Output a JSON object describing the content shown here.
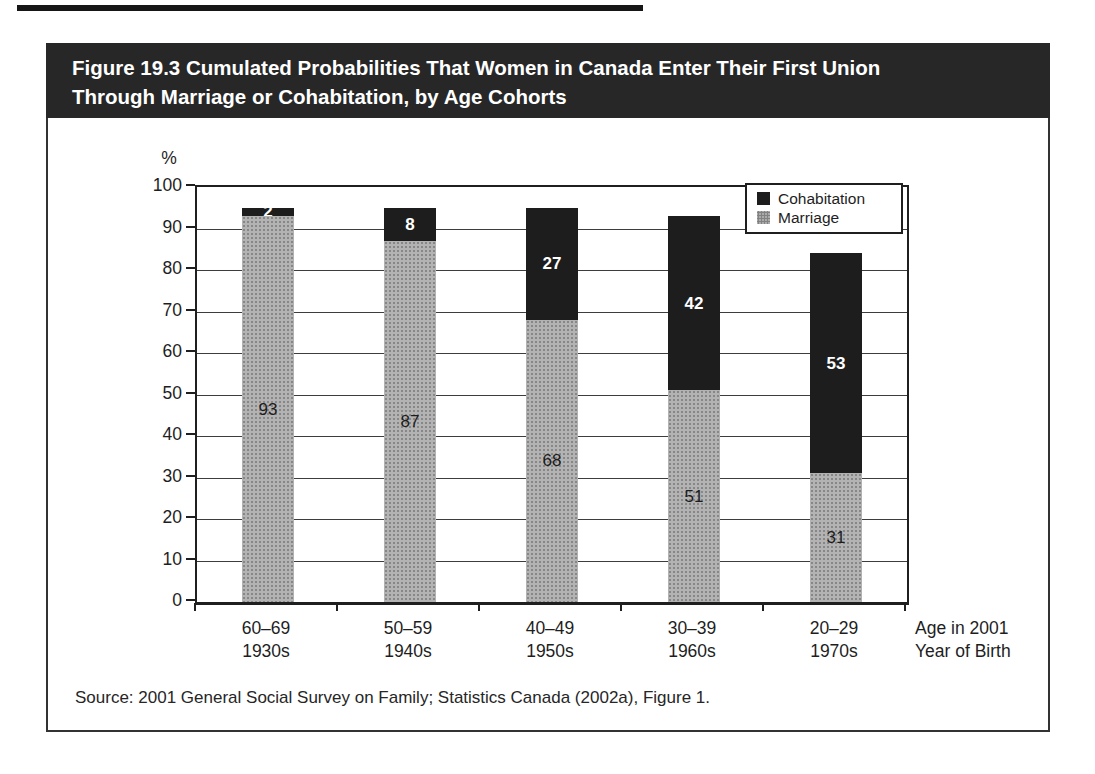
{
  "figure": {
    "title_line1": "Figure 19.3 Cumulated Probabilities That Women in Canada Enter Their First Union",
    "title_line2": "Through Marriage or Cohabitation, by Age Cohorts",
    "source": "Source: 2001 General Social Survey on Family; Statistics Canada (2002a), Figure 1."
  },
  "chart_data": {
    "type": "bar",
    "stacked": true,
    "title": "Figure 19.3 Cumulated Probabilities That Women in Canada Enter Their First Union Through Marriage or Cohabitation, by Age Cohorts",
    "unit_label": "%",
    "ylim": [
      0,
      100
    ],
    "yticks": [
      0,
      10,
      20,
      30,
      40,
      50,
      60,
      70,
      80,
      90,
      100
    ],
    "ytick_interval": 10,
    "grid": true,
    "categories": [
      "60–69",
      "50–59",
      "40–49",
      "30–39",
      "20–29"
    ],
    "cohorts": [
      "1930s",
      "1940s",
      "1950s",
      "1960s",
      "1970s"
    ],
    "series": [
      {
        "name": "Marriage",
        "color": "#b3b3b3",
        "values": [
          93,
          87,
          68,
          51,
          31
        ]
      },
      {
        "name": "Cohabitation",
        "color": "#1d1d1d",
        "values": [
          2,
          8,
          27,
          42,
          53
        ]
      }
    ],
    "legend_position": "top-right",
    "legend_entries": [
      "Cohabitation",
      "Marriage"
    ],
    "x_axis_note_line1": "Age in 2001",
    "x_axis_note_line2": "Year of Birth"
  }
}
